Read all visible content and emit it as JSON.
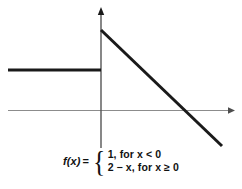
{
  "figure": {
    "title": "",
    "background_color": "#ffffff"
  },
  "chart_data": {
    "type": "line",
    "title": "",
    "xlabel": "",
    "ylabel": "",
    "grid": false,
    "legend": null,
    "axes": {
      "x_axis": {
        "visible": true,
        "arrow": "right",
        "color": "#8c8c8c",
        "y_pixel": 110
      },
      "y_axis": {
        "visible": true,
        "arrow": "up",
        "color": "#555555",
        "x_pixel": 101
      },
      "ticks": [],
      "tick_labels": []
    },
    "series": [
      {
        "name": "1, for x < 0",
        "type": "ray",
        "color": "#1a1a1a",
        "linewidth": 3,
        "points": [
          [
            8,
            70
          ],
          [
            101,
            70
          ]
        ],
        "value": 1,
        "domain": "x < 0"
      },
      {
        "name": "2 - x, for x >= 0",
        "type": "line",
        "color": "#1a1a1a",
        "linewidth": 3,
        "points": [
          [
            101,
            30
          ],
          [
            222,
            146
          ]
        ],
        "slope": -1,
        "intercept": 2,
        "domain": "x >= 0"
      }
    ]
  },
  "formula": {
    "function_name": "f(x)",
    "equals": "=",
    "brace": "{",
    "cases": [
      {
        "expression": "1,",
        "condition": "for x < 0"
      },
      {
        "expression": "2 − x,",
        "condition": "for x ≥ 0"
      }
    ],
    "full_text": "f(x) = { 1, for x < 0 ; 2 − x, for x ≥ 0"
  }
}
